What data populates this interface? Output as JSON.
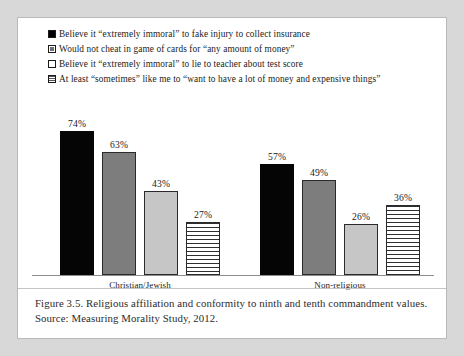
{
  "chart_data": {
    "type": "bar",
    "title": "",
    "xlabel": "",
    "ylabel": "",
    "ylim": [
      0,
      100
    ],
    "grid": false,
    "legend_position": "top-left",
    "categories": [
      "Christian/Jewish",
      "Non-religious"
    ],
    "series": [
      {
        "name": "Believe it “extremely immoral” to fake injury to collect insurance",
        "marker": "solid-black-square",
        "values": [
          74,
          63
        ],
        "labels": [
          "74%",
          "63%"
        ]
      },
      {
        "name": "Would not cheat in game of cards for “any amount of money”",
        "marker": "gray-square",
        "values": [
          63,
          49
        ],
        "labels": [
          "63%",
          "49%"
        ]
      },
      {
        "name": "Believe it “extremely immoral” to lie to teacher about test score",
        "marker": "light-gray-square",
        "values": [
          43,
          26
        ],
        "labels": [
          "43%",
          "26%"
        ]
      },
      {
        "name": "At least “sometimes” like me to “want to have a lot of money and expensive things”",
        "marker": "horizontal-striped-square",
        "values": [
          27,
          36
        ],
        "labels": [
          "27%",
          "36%"
        ]
      }
    ],
    "groups": [
      {
        "category": "Christian/Jewish",
        "bars": [
          {
            "label": "74%",
            "value": 74,
            "style": "s0"
          },
          {
            "label": "63%",
            "value": 63,
            "style": "s1"
          },
          {
            "label": "43%",
            "value": 43,
            "style": "s2"
          },
          {
            "label": "27%",
            "value": 27,
            "style": "s3"
          }
        ]
      },
      {
        "category": "Non-religious",
        "bars": [
          {
            "label": "57%",
            "value": 57,
            "style": "s0"
          },
          {
            "label": "49%",
            "value": 49,
            "style": "s1"
          },
          {
            "label": "26%",
            "value": 26,
            "style": "s2"
          },
          {
            "label": "36%",
            "value": 36,
            "style": "s3"
          }
        ]
      }
    ],
    "colors": {
      "series_1": "#050505",
      "series_2": "#7d7d7d",
      "series_3": "#c6c6c6",
      "series_4": "#ffffff",
      "axis": "#8d8d8d",
      "text": "#1b1b1b",
      "page_background": "#d8d8d8",
      "figure_background": "#ffffff"
    }
  },
  "legend": {
    "items": [
      {
        "marker": "solid-black-square",
        "label": "Believe it “extremely immoral” to fake injury to collect insurance"
      },
      {
        "marker": "gray-square",
        "label": "Would not cheat in game of cards for “any amount of money”"
      },
      {
        "marker": "light-gray-square",
        "label": "Believe it “extremely immoral” to lie to teacher about test score"
      },
      {
        "marker": "horizontal-striped-square",
        "label": "At least “sometimes” like me to “want to have a lot of money and expensive things”"
      }
    ]
  },
  "caption": {
    "text": "Figure 3.5. Religious affiliation and conformity to ninth and tenth commandment values. Source: Measuring Morality Study, 2012."
  }
}
